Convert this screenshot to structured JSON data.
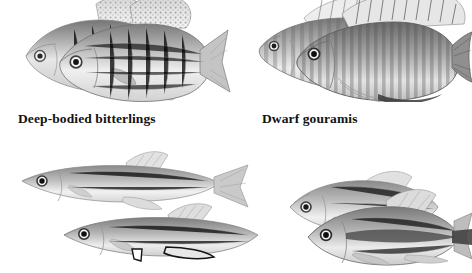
{
  "page": {
    "background_color": "#ffffff",
    "ink_color": "#121212",
    "width": 472,
    "height": 273,
    "style": "grayscale halftone book plate, four fish groups, two captions"
  },
  "captions": {
    "bitterlings": "Deep-bodied bitterlings",
    "gouramis": "Dwarf gouramis"
  },
  "groups": [
    {
      "id": "bitterlings",
      "name": "deep-bodied-bitterlings",
      "caption": "Deep-bodied bitterlings",
      "count": 2,
      "facing": "left",
      "position": "top-left",
      "features": "deep oval bodies, speckled dorsal and anal fins, forked tail, cropped at top edge"
    },
    {
      "id": "gouramis",
      "name": "dwarf-gouramis",
      "caption": "Dwarf gouramis",
      "count": 2,
      "facing": "left",
      "position": "top-right",
      "features": "vertical banded stripes, thread-like pelvic feelers, rounded caudal fin, cropped at top edge"
    },
    {
      "id": "slender",
      "name": "slender-minnows",
      "caption": "",
      "count": 2,
      "facing": "left",
      "position": "bottom-left",
      "features": "elongate torpedo bodies, pointed snout, dorsal fin set far back, dark inked lower fins"
    },
    {
      "id": "tetras",
      "name": "striped-tetras",
      "caption": "",
      "count": 2,
      "facing": "left",
      "position": "bottom-right",
      "features": "dark lateral stripe running into the tail base, deep forked caudal fin"
    }
  ]
}
